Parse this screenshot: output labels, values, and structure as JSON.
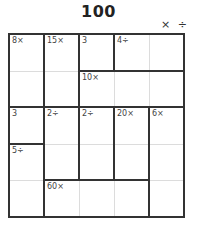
{
  "puzzle": {
    "title": "100",
    "operations_label": "× ÷",
    "size": 5,
    "colors": {
      "thick_line": "#333333",
      "thin_line": "#dcdcdc",
      "clue_text": "#444444",
      "title_text": "#222222"
    },
    "cages": [
      {
        "clue": "8×",
        "cells": [
          [
            0,
            0
          ],
          [
            1,
            0
          ]
        ]
      },
      {
        "clue": "15×",
        "cells": [
          [
            0,
            1
          ],
          [
            1,
            1
          ]
        ]
      },
      {
        "clue": "3",
        "cells": [
          [
            0,
            2
          ]
        ]
      },
      {
        "clue": "4÷",
        "cells": [
          [
            0,
            3
          ],
          [
            0,
            4
          ]
        ]
      },
      {
        "clue": "10×",
        "cells": [
          [
            1,
            2
          ],
          [
            1,
            3
          ],
          [
            1,
            4
          ]
        ]
      },
      {
        "clue": "3",
        "cells": [
          [
            2,
            0
          ]
        ]
      },
      {
        "clue": "2÷",
        "cells": [
          [
            2,
            1
          ],
          [
            3,
            1
          ]
        ]
      },
      {
        "clue": "2÷",
        "cells": [
          [
            2,
            2
          ],
          [
            3,
            2
          ]
        ]
      },
      {
        "clue": "20×",
        "cells": [
          [
            2,
            3
          ],
          [
            3,
            3
          ]
        ]
      },
      {
        "clue": "6×",
        "cells": [
          [
            2,
            4
          ],
          [
            3,
            4
          ],
          [
            4,
            4
          ]
        ]
      },
      {
        "clue": "5÷",
        "cells": [
          [
            3,
            0
          ],
          [
            4,
            0
          ]
        ]
      },
      {
        "clue": "60×",
        "cells": [
          [
            4,
            1
          ],
          [
            4,
            2
          ],
          [
            4,
            3
          ]
        ]
      }
    ]
  }
}
